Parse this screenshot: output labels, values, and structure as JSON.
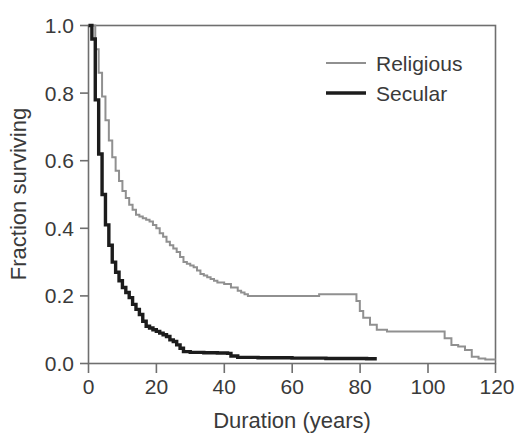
{
  "chart_data": {
    "type": "line",
    "title": "",
    "xlabel": "Duration (years)",
    "ylabel": "Fraction surviving",
    "xlim": [
      0,
      120
    ],
    "ylim": [
      0.0,
      1.0
    ],
    "xticks": [
      0,
      20,
      40,
      60,
      80,
      100,
      120
    ],
    "xtick_labels": [
      "0",
      "20",
      "40",
      "60",
      "80",
      "100",
      "120"
    ],
    "yticks": [
      0.0,
      0.2,
      0.4,
      0.6,
      0.8,
      1.0
    ],
    "ytick_labels": [
      "0.0",
      "0.2",
      "0.4",
      "0.6",
      "0.8",
      "1.0"
    ],
    "grid": false,
    "legend_position": "top-right",
    "step_type": "post",
    "series": [
      {
        "name": "Religious",
        "color": "#909090",
        "line_width": 2.0,
        "x": [
          0,
          1,
          2,
          3,
          4,
          5,
          6,
          7,
          8,
          9,
          10,
          11,
          12,
          13,
          14,
          15,
          16,
          17,
          18,
          19,
          20,
          21,
          22,
          23,
          24,
          25,
          26,
          27,
          28,
          29,
          30,
          31,
          32,
          33,
          34,
          35,
          36,
          37,
          38,
          40,
          42,
          44,
          45,
          46,
          47,
          48,
          60,
          64,
          68,
          72,
          76,
          78,
          79,
          80,
          81,
          83,
          85,
          88,
          92,
          100,
          103,
          105,
          107,
          109,
          111,
          113,
          115,
          117,
          120
        ],
        "y": [
          1.0,
          1.0,
          0.93,
          0.86,
          0.79,
          0.72,
          0.66,
          0.61,
          0.57,
          0.54,
          0.51,
          0.49,
          0.47,
          0.455,
          0.44,
          0.435,
          0.43,
          0.425,
          0.42,
          0.41,
          0.4,
          0.385,
          0.375,
          0.36,
          0.35,
          0.34,
          0.33,
          0.315,
          0.3,
          0.295,
          0.29,
          0.285,
          0.275,
          0.265,
          0.26,
          0.255,
          0.25,
          0.245,
          0.24,
          0.235,
          0.225,
          0.215,
          0.21,
          0.205,
          0.2,
          0.2,
          0.2,
          0.2,
          0.205,
          0.205,
          0.205,
          0.205,
          0.185,
          0.155,
          0.135,
          0.115,
          0.1,
          0.095,
          0.095,
          0.095,
          0.095,
          0.075,
          0.055,
          0.05,
          0.04,
          0.02,
          0.015,
          0.012,
          0.012
        ]
      },
      {
        "name": "Secular",
        "color": "#1c1c1c",
        "line_width": 3.4,
        "x": [
          0,
          1,
          2,
          3,
          4,
          5,
          6,
          7,
          8,
          9,
          10,
          11,
          12,
          13,
          14,
          15,
          16,
          17,
          18,
          19,
          20,
          21,
          22,
          23,
          24,
          25,
          26,
          27,
          28,
          30,
          34,
          38,
          41,
          42,
          44,
          50,
          60,
          70,
          78,
          82,
          85
        ],
        "y": [
          1.0,
          0.96,
          0.78,
          0.62,
          0.5,
          0.41,
          0.35,
          0.3,
          0.27,
          0.245,
          0.225,
          0.21,
          0.195,
          0.175,
          0.16,
          0.145,
          0.125,
          0.11,
          0.105,
          0.1,
          0.095,
          0.09,
          0.085,
          0.08,
          0.07,
          0.065,
          0.055,
          0.045,
          0.035,
          0.033,
          0.032,
          0.031,
          0.03,
          0.022,
          0.018,
          0.017,
          0.016,
          0.015,
          0.015,
          0.014,
          0.014
        ]
      }
    ]
  },
  "legend": {
    "items": [
      {
        "label": "Religious"
      },
      {
        "label": "Secular"
      }
    ]
  },
  "axes": {
    "x_title": "Duration (years)",
    "y_title": "Fraction surviving"
  }
}
